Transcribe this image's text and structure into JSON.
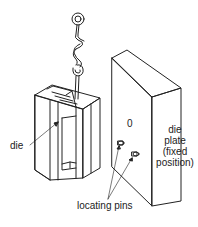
{
  "diagram": {
    "type": "technical illustration",
    "colors": {
      "stroke": "#222222",
      "background": "#ffffff"
    },
    "labels": {
      "die": "die",
      "die_plate_line1": "die",
      "die_plate_line2": "plate",
      "die_plate_line3": "(fixed",
      "die_plate_line4": "position)",
      "hole_marker": "0",
      "locating_pins": "locating pins"
    },
    "components": [
      {
        "name": "hanging hook assembly"
      },
      {
        "name": "die"
      },
      {
        "name": "die plate",
        "note": "fixed position"
      },
      {
        "name": "locating pins",
        "count": 2
      }
    ]
  }
}
